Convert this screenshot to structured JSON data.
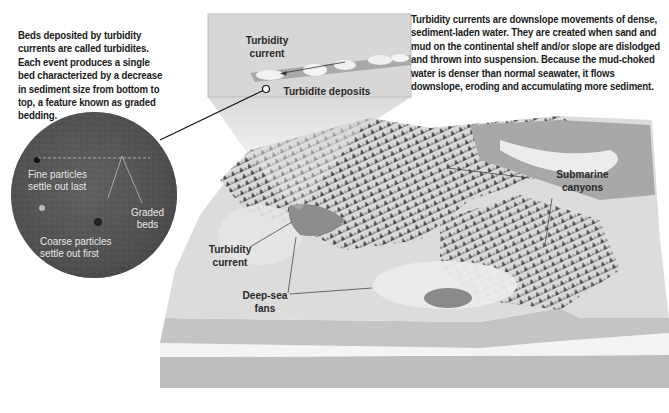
{
  "left_paragraph": "Beds deposited by turbidity currents are called turbidites. Each event produces a single bed characterized by a decrease in sediment size from bottom to top, a feature known as graded bedding.",
  "right_paragraph": "Turbidity currents are downslope movements of dense, sediment-laden water. They are created when sand and mud on the continental shelf and/or slope are dislodged and thrown into suspension. Because the mud-choked water is denser than normal seawater, it flows downslope, eroding and accumulating more sediment.",
  "inset": {
    "turbidity_current_line1": "Turbidity",
    "turbidity_current_line2": "current",
    "deposits_label": "Turbidite deposits"
  },
  "circle_inset": {
    "fine_line1": "Fine particles",
    "fine_line2": "settle out last",
    "graded_line1": "Graded",
    "graded_line2": "beds",
    "coarse_line1": "Coarse particles",
    "coarse_line2": "settle out first"
  },
  "map_labels": {
    "turbidity_current_line1": "Turbidity",
    "turbidity_current_line2": "current",
    "deep_sea_fans_line1": "Deep-sea",
    "deep_sea_fans_line2": "fans",
    "submarine_canyons_line1": "Submarine",
    "submarine_canyons_line2": "canyons"
  }
}
